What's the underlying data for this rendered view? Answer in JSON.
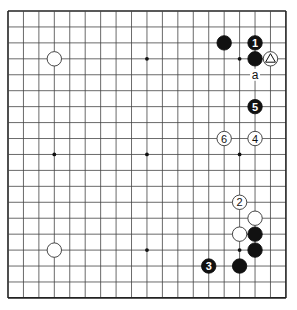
{
  "board": {
    "size": 19,
    "origin_x": 8,
    "origin_y": 11,
    "spacing_x": 15.44,
    "spacing_y": 15.94,
    "stone_radius": 7.2,
    "line_color": "#444444",
    "border_color": "#222222",
    "black_color": "#111111",
    "white_color": "#ffffff",
    "star_points": [
      [
        3,
        3
      ],
      [
        9,
        3
      ],
      [
        15,
        3
      ],
      [
        3,
        9
      ],
      [
        9,
        9
      ],
      [
        15,
        9
      ],
      [
        3,
        15
      ],
      [
        9,
        15
      ],
      [
        15,
        15
      ]
    ]
  },
  "stones": [
    {
      "name": "white-stone-top-left-star",
      "color": "white",
      "col": 3,
      "row": 3,
      "label": ""
    },
    {
      "name": "black-stone",
      "color": "black",
      "col": 14,
      "row": 2,
      "label": ""
    },
    {
      "name": "black-stone-move-1",
      "color": "black",
      "col": 16,
      "row": 2,
      "label": "1"
    },
    {
      "name": "black-stone",
      "color": "black",
      "col": 16,
      "row": 3,
      "label": ""
    },
    {
      "name": "white-stone-triangle-marked",
      "color": "white",
      "col": 17,
      "row": 3,
      "label": "",
      "mark": "triangle"
    },
    {
      "name": "black-stone-move-5",
      "color": "black",
      "col": 16,
      "row": 6,
      "label": "5"
    },
    {
      "name": "white-stone-move-6",
      "color": "white",
      "col": 14,
      "row": 8,
      "label": "6"
    },
    {
      "name": "white-stone-move-4",
      "color": "white",
      "col": 16,
      "row": 8,
      "label": "4"
    },
    {
      "name": "white-stone-move-2",
      "color": "white",
      "col": 15,
      "row": 12,
      "label": "2"
    },
    {
      "name": "white-stone",
      "color": "white",
      "col": 16,
      "row": 13,
      "label": ""
    },
    {
      "name": "white-stone",
      "color": "white",
      "col": 15,
      "row": 14,
      "label": ""
    },
    {
      "name": "black-stone",
      "color": "black",
      "col": 16,
      "row": 14,
      "label": ""
    },
    {
      "name": "black-stone",
      "color": "black",
      "col": 16,
      "row": 15,
      "label": ""
    },
    {
      "name": "black-stone",
      "color": "black",
      "col": 15,
      "row": 16,
      "label": ""
    },
    {
      "name": "black-stone-move-3",
      "color": "black",
      "col": 13,
      "row": 16,
      "label": "3"
    },
    {
      "name": "white-stone-bottom-left-star",
      "color": "white",
      "col": 3,
      "row": 15,
      "label": ""
    }
  ],
  "point_labels": [
    {
      "name": "point-label-a",
      "col": 16,
      "row": 4,
      "text": "a"
    }
  ]
}
